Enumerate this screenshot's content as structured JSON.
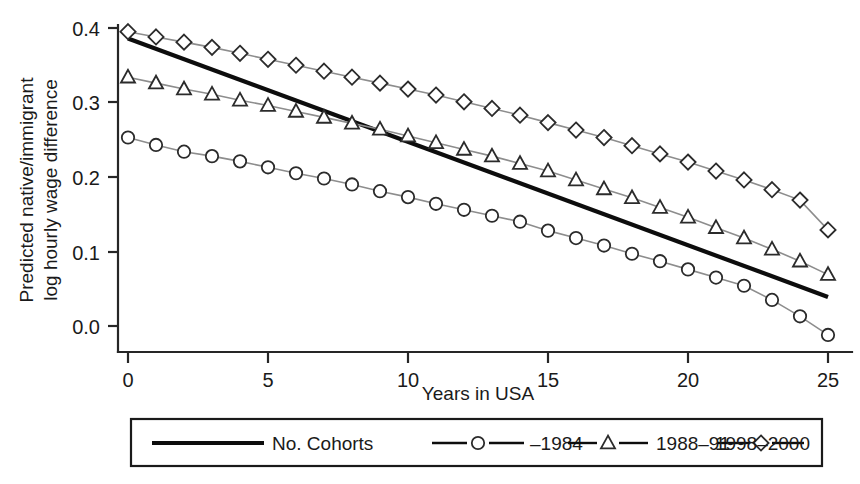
{
  "chart_data": {
    "type": "line",
    "title": "",
    "xlabel": "Years in USA",
    "ylabel_line1": "Predicted native/immigrant",
    "ylabel_line2": "log hourly wage difference",
    "xlim": [
      0,
      25
    ],
    "ylim": [
      -0.025,
      0.41
    ],
    "grid": false,
    "legend_position": "below",
    "xticks": [
      0,
      5,
      10,
      15,
      20,
      25
    ],
    "xtick_labels": [
      "0",
      "5",
      "10",
      "15",
      "20",
      "25"
    ],
    "yticks": [
      0.0,
      0.1,
      0.2,
      0.3,
      0.4
    ],
    "ytick_labels": [
      "0.0",
      "0.1",
      "0.2",
      "0.3",
      "0.4"
    ],
    "x": [
      0,
      1,
      2,
      3,
      4,
      5,
      6,
      7,
      8,
      9,
      10,
      11,
      12,
      13,
      14,
      15,
      16,
      17,
      18,
      19,
      20,
      21,
      22,
      23,
      24,
      25
    ],
    "series": [
      {
        "name": "No. Cohorts",
        "marker": "none",
        "line_style": "solid-thick",
        "color": "#0d0d0d",
        "x": [
          0,
          25
        ],
        "values": [
          0.386,
          0.039
        ]
      },
      {
        "name": "–1984",
        "marker": "circle",
        "line_style": "thin",
        "color": "#8d8d8d",
        "values": [
          0.253,
          0.243,
          0.234,
          0.228,
          0.221,
          0.213,
          0.205,
          0.198,
          0.19,
          0.181,
          0.173,
          0.164,
          0.156,
          0.148,
          0.14,
          0.128,
          0.118,
          0.108,
          0.097,
          0.087,
          0.076,
          0.065,
          0.054,
          0.035,
          0.013,
          -0.012
        ]
      },
      {
        "name": "1988–91",
        "marker": "triangle",
        "line_style": "thin",
        "color": "#8d8d8d",
        "values": [
          0.334,
          0.326,
          0.318,
          0.311,
          0.303,
          0.296,
          0.288,
          0.28,
          0.272,
          0.264,
          0.255,
          0.246,
          0.237,
          0.228,
          0.218,
          0.208,
          0.196,
          0.184,
          0.172,
          0.159,
          0.146,
          0.132,
          0.118,
          0.103,
          0.087,
          0.069
        ]
      },
      {
        "name": "1998–2000",
        "marker": "diamond",
        "line_style": "thin",
        "color": "#8d8d8d",
        "values": [
          0.395,
          0.388,
          0.381,
          0.374,
          0.366,
          0.358,
          0.35,
          0.342,
          0.334,
          0.326,
          0.318,
          0.31,
          0.301,
          0.292,
          0.283,
          0.273,
          0.263,
          0.253,
          0.242,
          0.231,
          0.22,
          0.208,
          0.196,
          0.183,
          0.169,
          0.129
        ]
      }
    ]
  },
  "legend": {
    "entries": [
      {
        "label": "No. Cohorts",
        "marker": "none"
      },
      {
        "label": "–1984",
        "marker": "circle"
      },
      {
        "label": "1988–91",
        "marker": "triangle"
      },
      {
        "label": "1998–2000",
        "marker": "diamond"
      }
    ]
  }
}
